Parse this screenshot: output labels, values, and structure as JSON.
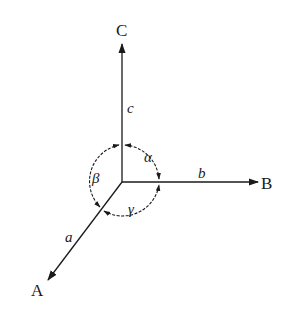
{
  "diagram": {
    "title": "",
    "axes": [
      {
        "id": "A",
        "label": "A",
        "edge": "a"
      },
      {
        "id": "B",
        "label": "B",
        "edge": "b"
      },
      {
        "id": "C",
        "label": "C",
        "edge": "c"
      }
    ],
    "angles": [
      {
        "symbol": "α",
        "between": [
          "b",
          "c"
        ]
      },
      {
        "symbol": "β",
        "between": [
          "a",
          "c"
        ]
      },
      {
        "symbol": "γ",
        "between": [
          "a",
          "b"
        ]
      }
    ],
    "colors": {
      "stroke": "#1a1a1a",
      "background": "#ffffff"
    }
  }
}
